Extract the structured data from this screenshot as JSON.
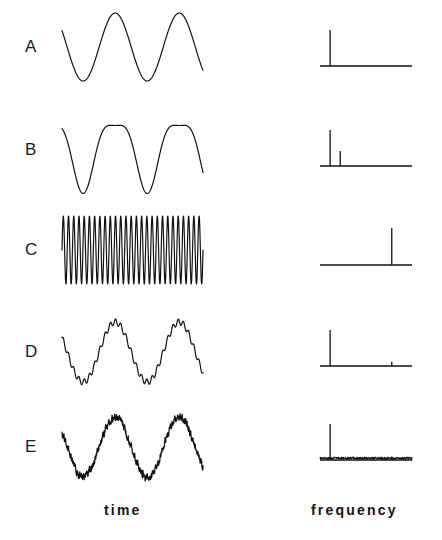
{
  "figure": {
    "background_color": "#ffffff",
    "stroke_color": "#111111",
    "rows": [
      {
        "label": "A",
        "signal_description": "pure sinusoid",
        "time_domain": {
          "type": "sine",
          "cycles": 2.2,
          "amplitude": 1.0,
          "noise_amplitude": 0.0,
          "ripple_amplitude": 0.0,
          "ripple_cycles": 0,
          "harmonic2_amplitude": 0.0,
          "phase": 0.42
        },
        "spectrum": {
          "peaks": [
            {
              "frequency": 0.11,
              "amplitude": 1.0
            }
          ],
          "noise_floor": 0.0
        }
      },
      {
        "label": "B",
        "signal_description": "sinusoid with second harmonic distortion",
        "time_domain": {
          "type": "sine",
          "cycles": 2.2,
          "amplitude": 1.0,
          "noise_amplitude": 0.0,
          "ripple_amplitude": 0.0,
          "ripple_cycles": 0,
          "harmonic2_amplitude": 0.28,
          "phase": 0.42
        },
        "spectrum": {
          "peaks": [
            {
              "frequency": 0.11,
              "amplitude": 1.0
            },
            {
              "frequency": 0.22,
              "amplitude": 0.42
            }
          ],
          "noise_floor": 0.0
        }
      },
      {
        "label": "C",
        "signal_description": "high frequency sinusoid",
        "time_domain": {
          "type": "sine",
          "cycles": 27,
          "amplitude": 1.0,
          "noise_amplitude": 0.0,
          "ripple_amplitude": 0.0,
          "ripple_cycles": 0,
          "harmonic2_amplitude": 0.0,
          "phase": 0.0
        },
        "spectrum": {
          "peaks": [
            {
              "frequency": 0.78,
              "amplitude": 1.0
            }
          ],
          "noise_floor": 0.0
        }
      },
      {
        "label": "D",
        "signal_description": "low frequency sinusoid plus high frequency ripple",
        "time_domain": {
          "type": "sine",
          "cycles": 2.2,
          "amplitude": 1.0,
          "noise_amplitude": 0.0,
          "ripple_amplitude": 0.1,
          "ripple_cycles": 27,
          "harmonic2_amplitude": 0.0,
          "phase": 0.42
        },
        "spectrum": {
          "peaks": [
            {
              "frequency": 0.11,
              "amplitude": 1.0
            },
            {
              "frequency": 0.78,
              "amplitude": 0.12
            }
          ],
          "noise_floor": 0.0
        }
      },
      {
        "label": "E",
        "signal_description": "low frequency sinusoid plus broadband noise",
        "time_domain": {
          "type": "sine",
          "cycles": 2.2,
          "amplitude": 1.0,
          "noise_amplitude": 0.13,
          "ripple_amplitude": 0.0,
          "ripple_cycles": 0,
          "harmonic2_amplitude": 0.0,
          "phase": 0.42
        },
        "spectrum": {
          "peaks": [
            {
              "frequency": 0.11,
              "amplitude": 1.0
            },
            {
              "frequency": 0.78,
              "amplitude": 0.1
            }
          ],
          "noise_floor": 0.05
        }
      }
    ],
    "captions": {
      "time": "time",
      "frequency": "frequency"
    }
  },
  "chart_data": {
    "type": "line",
    "title": "",
    "panel_count": 10,
    "columns": [
      "time",
      "frequency"
    ],
    "row_labels": [
      "A",
      "B",
      "C",
      "D",
      "E"
    ],
    "xlabel_left": "time",
    "xlabel_right": "frequency",
    "ylabel": "",
    "grid": false,
    "legend": false,
    "axis_ticks": false,
    "series": [
      {
        "name": "A time",
        "domain": "time",
        "description": "pure sinusoid, 2.2 cycles",
        "cycles": 2.2,
        "amplitude": 1.0
      },
      {
        "name": "A frequency",
        "domain": "frequency",
        "description": "single spectral line at fundamental",
        "x": [
          0.11
        ],
        "values": [
          1.0
        ]
      },
      {
        "name": "B time",
        "domain": "time",
        "description": "sinusoid with second harmonic, sharpened troughs",
        "cycles": 2.2,
        "amplitude": 1.0
      },
      {
        "name": "B frequency",
        "domain": "frequency",
        "description": "fundamental plus second harmonic",
        "x": [
          0.11,
          0.22
        ],
        "values": [
          1.0,
          0.42
        ]
      },
      {
        "name": "C time",
        "domain": "time",
        "description": "high frequency sinusoid, about 27 cycles",
        "cycles": 27,
        "amplitude": 1.0
      },
      {
        "name": "C frequency",
        "domain": "frequency",
        "description": "single spectral line at high frequency",
        "x": [
          0.78
        ],
        "values": [
          1.0
        ]
      },
      {
        "name": "D time",
        "domain": "time",
        "description": "low frequency sinusoid with small high frequency ripple",
        "cycles": 2.2,
        "amplitude": 1.0
      },
      {
        "name": "D frequency",
        "domain": "frequency",
        "description": "large low frequency line plus small high frequency line",
        "x": [
          0.11,
          0.78
        ],
        "values": [
          1.0,
          0.12
        ]
      },
      {
        "name": "E time",
        "domain": "time",
        "description": "low frequency sinusoid buried in broadband noise",
        "cycles": 2.2,
        "amplitude": 1.0
      },
      {
        "name": "E frequency",
        "domain": "frequency",
        "description": "large low frequency line over raised broadband noise floor",
        "x": [
          0.11,
          0.78
        ],
        "values": [
          1.0,
          0.1
        ],
        "noise_floor": 0.05
      }
    ]
  }
}
